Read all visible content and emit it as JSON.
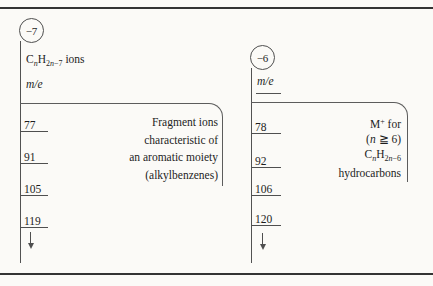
{
  "colors": {
    "background": "#fbfaf7",
    "ink": "#1d1d1d",
    "line": "#4f4f4f",
    "rule": "#343434"
  },
  "left_series": {
    "badge": "−7",
    "formula_runs": [
      {
        "t": "C"
      },
      {
        "t": "n",
        "s": "sub i"
      },
      {
        "t": "H"
      },
      {
        "t": "2",
        "s": "sub"
      },
      {
        "t": "n",
        "s": "sub i"
      },
      {
        "t": "−7",
        "s": "sub"
      },
      {
        "t": " ions"
      }
    ],
    "mass_label": "m/e",
    "values": [
      "77",
      "91",
      "105",
      "119"
    ],
    "note_lines": [
      "Fragment ions",
      "characteristic of",
      "an aromatic moiety",
      "(alkylbenzenes)"
    ]
  },
  "right_series": {
    "badge": "−6",
    "mass_label": "m/e",
    "values": [
      "78",
      "92",
      "106",
      "120"
    ],
    "note_runs": {
      "line1": [
        {
          "t": "M"
        },
        {
          "t": "+",
          "s": "sup"
        },
        {
          "t": " for"
        }
      ],
      "line2": [
        {
          "t": "("
        },
        {
          "t": "n",
          "s": "i"
        },
        {
          "t": " ≧ 6)"
        }
      ],
      "line3": [
        {
          "t": "C"
        },
        {
          "t": "n",
          "s": "sub i"
        },
        {
          "t": "H"
        },
        {
          "t": "2",
          "s": "sub"
        },
        {
          "t": "n",
          "s": "sub i"
        },
        {
          "t": "−6",
          "s": "sub"
        }
      ],
      "line4": [
        {
          "t": "hydrocarbons"
        }
      ]
    }
  }
}
